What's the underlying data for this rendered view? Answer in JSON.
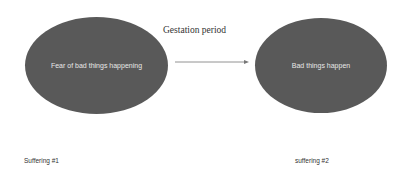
{
  "diagram": {
    "title": "Gestation period",
    "nodes": [
      {
        "id": "n1",
        "text": "Fear of bad things happening",
        "caption": "Suffering #1"
      },
      {
        "id": "n2",
        "text": "Bad things happen",
        "caption": "suffering #2"
      }
    ],
    "edges": [
      {
        "from": "n1",
        "to": "n2",
        "label": "Gestation period"
      }
    ],
    "colors": {
      "node_fill": "#595959",
      "node_text": "#e8e8e8",
      "arrow": "#777777"
    }
  }
}
